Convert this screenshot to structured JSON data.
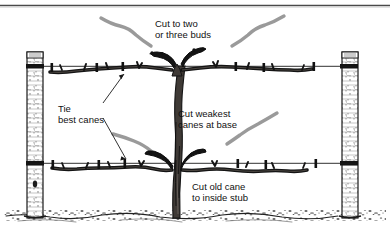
{
  "figure": {
    "background_color": "#ffffff",
    "ink_color": "#111111",
    "cut_cane_color": "#9a9a9a",
    "width": 390,
    "height": 235
  },
  "labels": {
    "top": {
      "line1": "Cut to two",
      "line2": "or three buds"
    },
    "left": {
      "line1": "Tie",
      "line2": "best canes"
    },
    "middle": {
      "line1": "Cut weakest",
      "line2": "canes at base"
    },
    "bottom": {
      "line1": "Cut old cane",
      "line2": "to inside stub"
    }
  },
  "parts": {
    "left_post": "left-trellis-post",
    "right_post": "right-trellis-post",
    "top_wire": "top-trellis-wire",
    "bottom_wire": "bottom-trellis-wire",
    "trunk": "vine-trunk",
    "ground": "ground-soil-line",
    "top_rule": "header-rule"
  }
}
